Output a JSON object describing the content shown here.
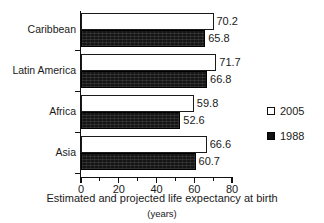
{
  "chart_data": {
    "type": "bar",
    "orientation": "horizontal",
    "title": "Estimated and projected life expectancy at birth",
    "subtitle": "(years)",
    "xlabel": "",
    "ylabel": "",
    "xlim": [
      0,
      80
    ],
    "xticks": [
      0,
      20,
      40,
      60,
      80
    ],
    "xtick_labels": [
      "0",
      "20",
      "40",
      "60",
      "80"
    ],
    "minor_xticks": [
      10,
      30,
      50,
      70
    ],
    "grid": false,
    "legend_position": "right",
    "categories": [
      "Caribbean",
      "Latin America",
      "Africa",
      "Asia"
    ],
    "series": [
      {
        "name": "2005",
        "style": "white-filled-black-outline",
        "values": [
          70.2,
          71.7,
          59.8,
          66.6
        ],
        "labels": [
          "70.2",
          "71.7",
          "59.8",
          "66.6"
        ]
      },
      {
        "name": "1988",
        "style": "solid-black",
        "values": [
          65.8,
          66.8,
          52.6,
          60.7
        ],
        "labels": [
          "65.8",
          "66.8",
          "52.6",
          "60.7"
        ]
      }
    ]
  },
  "legend": {
    "items": [
      {
        "label": "2005",
        "swatch": "light"
      },
      {
        "label": "1988",
        "swatch": "dark"
      }
    ]
  },
  "colors": {
    "axis": "#111111",
    "text": "#1a1a1a",
    "bar_2005_fill": "#ffffff",
    "bar_2005_border": "#1a1a1a",
    "bar_1988_fill": "#151515",
    "background": "#ffffff"
  }
}
